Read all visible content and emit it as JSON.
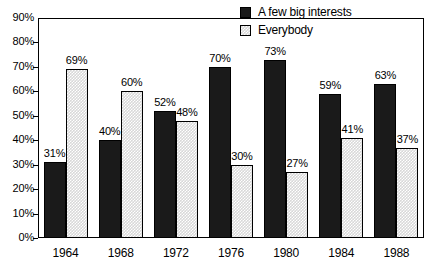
{
  "chart_data": {
    "type": "bar",
    "title": "",
    "subtitle": "",
    "xlabel": "",
    "ylabel": "",
    "categories": [
      "1964",
      "1968",
      "1972",
      "1976",
      "1980",
      "1984",
      "1988"
    ],
    "series": [
      {
        "name": "A few big interests",
        "color": "#1a1a1a",
        "fill": "solid-black",
        "values": [
          31,
          40,
          52,
          70,
          73,
          59,
          63
        ],
        "labels": [
          "31%",
          "40%",
          "52%",
          "70%",
          "73%",
          "59%",
          "63%"
        ]
      },
      {
        "name": "Everybody",
        "color": "#d8d8d8",
        "fill": "checkered-dot",
        "values": [
          69,
          60,
          48,
          30,
          27,
          41,
          37
        ],
        "labels": [
          "69%",
          "60%",
          "48%",
          "30%",
          "27%",
          "41%",
          "37%"
        ]
      }
    ],
    "ylim": [
      0,
      90
    ],
    "ytick_step": 10,
    "ytick_labels": [
      "0%",
      "10%",
      "20%",
      "30%",
      "40%",
      "50%",
      "60%",
      "70%",
      "80%",
      "90%"
    ],
    "ytick_values": [
      0,
      10,
      20,
      30,
      40,
      50,
      60,
      70,
      80,
      90
    ],
    "grid": false,
    "legend_position": "top-right-inside",
    "value_labels_shown": true
  },
  "legend": {
    "items": [
      {
        "label": "A few big interests",
        "swatch": "solid-black-square"
      },
      {
        "label": "Everybody",
        "swatch": "dotted-gray-square"
      }
    ]
  }
}
